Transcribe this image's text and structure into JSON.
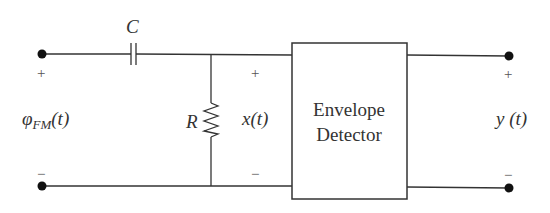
{
  "diagram": {
    "type": "circuit",
    "components": {
      "capacitor": {
        "label": "C"
      },
      "resistor": {
        "label": "R"
      },
      "block": {
        "line1": "Envelope",
        "line2": "Detector"
      }
    },
    "input": {
      "signal_main": "φ",
      "signal_sub": "FM",
      "signal_arg": "(t)",
      "plus": "+",
      "minus": "−"
    },
    "intermediate": {
      "signal_main": "x",
      "signal_arg": "(t)",
      "plus": "+",
      "minus": "−"
    },
    "output": {
      "signal_main": "y",
      "signal_arg": " (t)",
      "plus": "+",
      "minus": "−"
    },
    "colors": {
      "line": "#333333",
      "terminal": "#111111",
      "background": "#ffffff"
    }
  }
}
